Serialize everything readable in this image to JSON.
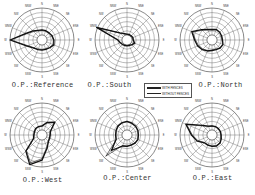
{
  "figure": {
    "legend": {
      "with_fences": "WITH FENCES",
      "without_fences": "WITHOUT FENCES"
    },
    "titles": [
      "O.P.:Reference",
      "O.P.:South",
      "O.P.:North",
      "O.P.:West",
      "O.P.:Center",
      "O.P.:East"
    ]
  },
  "chart_data": [
    {
      "type": "radar",
      "title": "O.P.:Reference",
      "directions": [
        "N",
        "NNE",
        "NE",
        "ENE",
        "E",
        "ESE",
        "SE",
        "SSE",
        "S",
        "SSW",
        "SW",
        "WSW",
        "W",
        "WNW",
        "NW",
        "NNW"
      ],
      "rings": 7,
      "grid": true,
      "calm_circle": true,
      "series": [
        {
          "name": "WITH FENCES",
          "values": [
            2.2,
            2.2,
            2.2,
            2.4,
            2.6,
            2.8,
            2.4,
            2.2,
            2.2,
            2.3,
            2.5,
            3.5,
            7.0,
            3.8,
            2.8,
            2.3
          ]
        },
        {
          "name": "WITHOUT FENCES",
          "values": [
            2.1,
            2.1,
            2.1,
            2.3,
            2.5,
            2.6,
            2.3,
            2.1,
            2.1,
            2.2,
            2.4,
            3.3,
            6.8,
            3.6,
            2.6,
            2.2
          ]
        }
      ]
    },
    {
      "type": "radar",
      "title": "O.P.:South",
      "directions": [
        "N",
        "NNE",
        "NE",
        "ENE",
        "E",
        "ESE",
        "SE",
        "SSE",
        "S",
        "SSW",
        "SW",
        "WSW",
        "W",
        "WNW",
        "NW",
        "NNW"
      ],
      "rings": 7,
      "grid": true,
      "calm_circle": true,
      "series": [
        {
          "name": "WITH FENCES",
          "values": [
            1.3,
            1.3,
            1.3,
            1.4,
            1.4,
            1.8,
            1.5,
            1.3,
            1.3,
            1.3,
            1.4,
            1.6,
            2.0,
            7.2,
            2.2,
            1.5
          ]
        },
        {
          "name": "WITHOUT FENCES",
          "values": [
            1.2,
            1.2,
            1.2,
            1.3,
            1.3,
            1.7,
            1.4,
            1.2,
            1.2,
            1.2,
            1.3,
            1.5,
            1.9,
            7.0,
            2.1,
            1.4
          ]
        }
      ]
    },
    {
      "type": "radar",
      "title": "O.P.:North",
      "directions": [
        "N",
        "NNE",
        "NE",
        "ENE",
        "E",
        "ESE",
        "SE",
        "SSE",
        "S",
        "SSW",
        "SW",
        "WSW",
        "W",
        "WNW",
        "NW",
        "NNW"
      ],
      "rings": 7,
      "grid": true,
      "calm_circle": true,
      "series": [
        {
          "name": "WITH FENCES",
          "values": [
            2.3,
            2.5,
            2.4,
            2.3,
            2.3,
            2.6,
            2.5,
            2.3,
            2.3,
            2.6,
            3.0,
            3.4,
            3.8,
            4.8,
            3.2,
            2.5
          ]
        },
        {
          "name": "WITHOUT FENCES",
          "values": [
            2.2,
            2.4,
            2.3,
            2.2,
            2.2,
            2.5,
            2.4,
            2.2,
            2.2,
            2.5,
            2.8,
            3.2,
            3.6,
            4.6,
            3.0,
            2.4
          ]
        }
      ]
    },
    {
      "type": "radar",
      "title": "O.P.:West",
      "directions": [
        "N",
        "NNE",
        "NE",
        "ENE",
        "E",
        "ESE",
        "SE",
        "SSE",
        "S",
        "SSW",
        "SW",
        "WSW",
        "W",
        "WNW",
        "NW",
        "NNW"
      ],
      "rings": 7,
      "grid": true,
      "calm_circle": true,
      "series": [
        {
          "name": "WITH FENCES",
          "values": [
            2.0,
            3.0,
            4.0,
            2.0,
            1.8,
            1.8,
            2.0,
            3.0,
            5.5,
            7.0,
            5.0,
            2.0,
            1.8,
            1.8,
            2.0,
            2.0
          ]
        },
        {
          "name": "WITHOUT FENCES",
          "values": [
            1.9,
            2.8,
            3.8,
            1.9,
            1.7,
            1.7,
            1.9,
            2.8,
            5.2,
            6.6,
            4.8,
            1.9,
            1.7,
            1.7,
            1.9,
            1.9
          ]
        }
      ]
    },
    {
      "type": "radar",
      "title": "O.P.:Center",
      "directions": [
        "N",
        "NNE",
        "NE",
        "ENE",
        "E",
        "ESE",
        "SE",
        "SSE",
        "S",
        "SSW",
        "SW",
        "WSW",
        "W",
        "WNW",
        "NW",
        "NNW"
      ],
      "rings": 7,
      "grid": true,
      "calm_circle": true,
      "series": [
        {
          "name": "WITH FENCES",
          "values": [
            3.0,
            2.8,
            2.7,
            2.6,
            2.5,
            2.6,
            2.5,
            2.4,
            2.5,
            2.6,
            4.8,
            2.6,
            2.5,
            2.6,
            2.8,
            2.9
          ]
        },
        {
          "name": "WITHOUT FENCES",
          "values": [
            2.9,
            2.7,
            2.6,
            2.5,
            2.4,
            2.5,
            2.4,
            2.3,
            2.4,
            2.5,
            6.5,
            2.5,
            2.4,
            2.5,
            2.7,
            2.8
          ]
        }
      ]
    },
    {
      "type": "radar",
      "title": "O.P.:East",
      "directions": [
        "N",
        "NNE",
        "NE",
        "ENE",
        "E",
        "ESE",
        "SE",
        "SSE",
        "S",
        "SSW",
        "SW",
        "WSW",
        "W",
        "WNW",
        "NW",
        "NNW"
      ],
      "rings": 7,
      "grid": true,
      "calm_circle": true,
      "series": [
        {
          "name": "WITH FENCES",
          "values": [
            2.0,
            2.0,
            2.0,
            2.0,
            2.0,
            2.2,
            2.5,
            2.6,
            2.5,
            2.4,
            2.4,
            3.5,
            4.5,
            6.2,
            3.0,
            2.1
          ]
        },
        {
          "name": "WITHOUT FENCES",
          "values": [
            1.9,
            1.9,
            1.9,
            1.9,
            1.9,
            2.1,
            2.4,
            2.5,
            2.4,
            2.3,
            2.3,
            3.3,
            4.3,
            6.0,
            2.8,
            2.0
          ]
        }
      ]
    }
  ]
}
